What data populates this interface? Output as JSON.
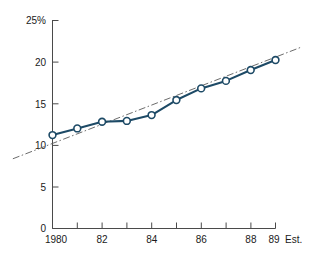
{
  "chart_data": {
    "type": "line",
    "title": "",
    "subtitle": "",
    "xlabel": "",
    "ylabel": "",
    "x": [
      1980,
      1981,
      1982,
      1983,
      1984,
      1985,
      1986,
      1987,
      1988,
      1989
    ],
    "categories": [
      "1980",
      "81",
      "82",
      "83",
      "84",
      "85",
      "86",
      "87",
      "88",
      "89"
    ],
    "series": [
      {
        "name": "Actual",
        "values": [
          11.2,
          12.0,
          12.8,
          12.9,
          13.6,
          15.4,
          16.8,
          17.7,
          19.0,
          20.2
        ],
        "style": "solid-with-markers",
        "color": "#1d4a66"
      },
      {
        "name": "Trend",
        "values": [
          10.2,
          11.35,
          12.5,
          13.65,
          14.8,
          15.95,
          17.1,
          18.25,
          19.4,
          20.55
        ],
        "style": "dash-dot",
        "color": "#5a5a5a"
      }
    ],
    "xlim": [
      1980,
      1989
    ],
    "ylim": [
      0,
      25
    ],
    "yticks": [
      0,
      5,
      10,
      15,
      20,
      25
    ],
    "ytick_labels": [
      "0",
      "5",
      "10",
      "15",
      "20",
      "25%"
    ],
    "xticks": [
      1980,
      1981,
      1982,
      1983,
      1984,
      1985,
      1986,
      1987,
      1988,
      1989
    ],
    "xtick_labels": [
      "1980",
      "",
      "82",
      "",
      "84",
      "",
      "86",
      "",
      "88",
      "89"
    ],
    "grid": false,
    "legend": "none",
    "annotations": [
      {
        "text": "Est.",
        "x": 1989.5,
        "y": 0,
        "note": "estimate marker after last year label"
      }
    ]
  },
  "axis": {
    "y": {
      "labels": [
        {
          "value": 25,
          "text": "25%"
        },
        {
          "value": 20,
          "text": "20"
        },
        {
          "value": 15,
          "text": "15"
        },
        {
          "value": 10,
          "text": "10"
        },
        {
          "value": 5,
          "text": "5"
        },
        {
          "value": 0,
          "text": "0"
        }
      ]
    },
    "x": {
      "labels": [
        {
          "value": 1980,
          "text": "1980"
        },
        {
          "value": 1982,
          "text": "82"
        },
        {
          "value": 1984,
          "text": "84"
        },
        {
          "value": 1986,
          "text": "86"
        },
        {
          "value": 1988,
          "text": "88"
        },
        {
          "value": 1989,
          "text": "89"
        }
      ],
      "suffix": "Est."
    }
  },
  "colors": {
    "background": "#ffffff",
    "axis": "#4a4a4a",
    "text": "#1a1a1a",
    "data_line": "#1d4a66",
    "marker_fill": "#ffffff",
    "marker_stroke": "#1d4a66",
    "trend_line": "#5a5a5a"
  }
}
